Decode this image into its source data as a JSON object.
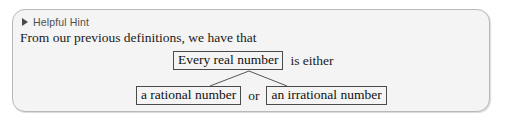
{
  "panel": {
    "header": {
      "icon": "triangle-right-icon",
      "title": "Helpful Hint"
    },
    "intro_text": "From our previous definitions, we have that"
  },
  "diagram": {
    "type": "tree",
    "root": {
      "box_label": "Every real number",
      "trailing_text": "is either"
    },
    "children": [
      {
        "box_label": "a rational number"
      },
      {
        "box_label": "an irrational number"
      }
    ],
    "connector_label": "or"
  },
  "colors": {
    "panel_background": "#f4f4f4",
    "panel_border": "#b9b9b9",
    "page_background": "#ffffff",
    "box_border": "#4a4a4a",
    "body_text": "#1a1a1a",
    "header_text": "#4f4f4f",
    "connector_line": "#555555"
  }
}
